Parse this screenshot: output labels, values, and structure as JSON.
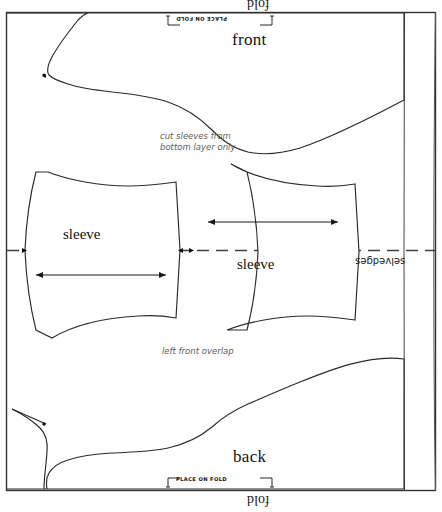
{
  "diagram": {
    "fabric": {
      "fold_top_label": "fold",
      "fold_bottom_label": "fold",
      "selvedge_label": "selvedges"
    },
    "fold_markers": [
      {
        "id": "top",
        "label": "PLACE ON FOLD"
      },
      {
        "id": "bottom",
        "label": "PLACE ON FOLD"
      }
    ],
    "pieces": [
      {
        "id": "front",
        "label": "front"
      },
      {
        "id": "sleeve-left",
        "label": "sleeve"
      },
      {
        "id": "sleeve-right",
        "label": "sleeve"
      },
      {
        "id": "back",
        "label": "back"
      }
    ],
    "notes": [
      {
        "id": "cut-sleeves",
        "line1": "cut sleeves from",
        "line2": "bottom layer only"
      },
      {
        "id": "left-front-overlap",
        "line1": "left front overlap",
        "line2": ""
      }
    ],
    "colors": {
      "ink": "#1a1a1a",
      "outline": "#2a2a2a",
      "note": "#5d5d5d",
      "paper": "#ffffff",
      "dash": "#4a4a4a"
    }
  }
}
